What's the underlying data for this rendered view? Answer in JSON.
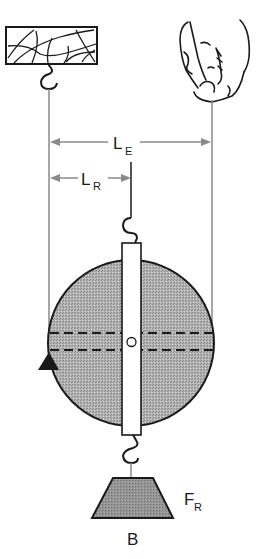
{
  "diagram": {
    "type": "lever-balance-diagram",
    "labels": {
      "effort_arm": {
        "main": "L",
        "sub": "E"
      },
      "resistance_arm": {
        "main": "L",
        "sub": "R"
      },
      "resistance_force": {
        "main": "F",
        "sub": "R"
      },
      "weight": "B"
    },
    "icons": {
      "ceiling_mount": "ceiling-block-icon",
      "hand": "hand-holding-string-icon",
      "fulcrum": "triangle-fulcrum-icon",
      "weight": "trapezoid-weight-icon"
    },
    "colors": {
      "line": "#1a1a1a",
      "string": "#8a8a8a",
      "disc_fill": "#a9a9a9",
      "weight_fill": "#8c8c8c",
      "background": "#ffffff"
    }
  }
}
